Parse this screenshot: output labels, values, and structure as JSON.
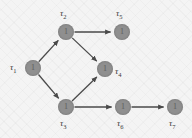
{
  "diagram": {
    "type": "directed-acyclic-graph",
    "title": "",
    "node_fill_color": "#8f8f8f",
    "edge_color": "#4a4a4a",
    "background_color": "#f4f4f4",
    "nodes": [
      {
        "id": "t1",
        "label_greek": "τ",
        "label_sub": "1",
        "inner_value": "1",
        "cx": 33,
        "cy": 68,
        "r": 8,
        "label_x": 10,
        "label_y": 63,
        "label_pos": "left"
      },
      {
        "id": "t2",
        "label_greek": "τ",
        "label_sub": "2",
        "inner_value": "1",
        "cx": 66,
        "cy": 32,
        "r": 8,
        "label_x": 60,
        "label_y": 9,
        "label_pos": "top"
      },
      {
        "id": "t3",
        "label_greek": "τ",
        "label_sub": "3",
        "inner_value": "1",
        "cx": 66,
        "cy": 107,
        "r": 8,
        "label_x": 60,
        "label_y": 119,
        "label_pos": "bottom"
      },
      {
        "id": "t4",
        "label_greek": "τ",
        "label_sub": "4",
        "inner_value": "1",
        "cx": 105,
        "cy": 69,
        "r": 8,
        "label_x": 115,
        "label_y": 67,
        "label_pos": "right"
      },
      {
        "id": "t5",
        "label_greek": "τ",
        "label_sub": "5",
        "inner_value": "1",
        "cx": 122,
        "cy": 32,
        "r": 8,
        "label_x": 116,
        "label_y": 9,
        "label_pos": "top"
      },
      {
        "id": "t6",
        "label_greek": "τ",
        "label_sub": "6",
        "inner_value": "1",
        "cx": 123,
        "cy": 107,
        "r": 8,
        "label_x": 117,
        "label_y": 119,
        "label_pos": "bottom"
      },
      {
        "id": "t7",
        "label_greek": "τ",
        "label_sub": "7",
        "inner_value": "1",
        "cx": 175,
        "cy": 107,
        "r": 8,
        "label_x": 169,
        "label_y": 119,
        "label_pos": "bottom"
      }
    ],
    "edges": [
      {
        "id": "e-t1-t2",
        "from": "t1",
        "to": "t2"
      },
      {
        "id": "e-t1-t3",
        "from": "t1",
        "to": "t3"
      },
      {
        "id": "e-t2-t4",
        "from": "t2",
        "to": "t4"
      },
      {
        "id": "e-t2-t5",
        "from": "t2",
        "to": "t5"
      },
      {
        "id": "e-t3-t4",
        "from": "t3",
        "to": "t4"
      },
      {
        "id": "e-t3-t6",
        "from": "t3",
        "to": "t6"
      },
      {
        "id": "e-t6-t7",
        "from": "t6",
        "to": "t7"
      }
    ]
  }
}
